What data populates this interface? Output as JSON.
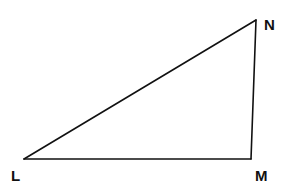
{
  "diagram": {
    "type": "triangle",
    "vertices": [
      {
        "id": "L",
        "label": "L"
      },
      {
        "id": "M",
        "label": "M"
      },
      {
        "id": "N",
        "label": "N"
      }
    ],
    "sides": [
      {
        "from": "L",
        "to": "M",
        "name": "LM"
      },
      {
        "from": "M",
        "to": "N",
        "name": "MN"
      },
      {
        "from": "N",
        "to": "L",
        "name": "NL"
      }
    ],
    "colors": {
      "stroke": "#111111",
      "background": "#ffffff"
    }
  }
}
